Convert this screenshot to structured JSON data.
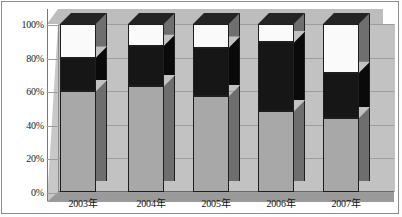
{
  "chart_data": {
    "type": "bar",
    "subtype": "stacked-100-percent-3d",
    "title": "",
    "xlabel": "",
    "ylabel": "",
    "ylim": [
      0,
      100
    ],
    "ytick_labels": [
      "0%",
      "20%",
      "40%",
      "60%",
      "80%",
      "100%"
    ],
    "ytick_values": [
      0,
      20,
      40,
      60,
      80,
      100
    ],
    "grid": true,
    "legend": "none",
    "categories": [
      "2003年",
      "2004年",
      "2005年",
      "2006年",
      "2007年"
    ],
    "series": [
      {
        "name": "bottom-gray",
        "color": "#a8a8a8",
        "values": [
          60,
          63,
          57,
          48,
          44
        ]
      },
      {
        "name": "middle-black",
        "color": "#161616",
        "values": [
          20,
          24,
          29,
          41,
          27
        ]
      },
      {
        "name": "top-white",
        "color": "#fafafa",
        "values": [
          20,
          13,
          14,
          11,
          29
        ]
      }
    ]
  },
  "axis": {
    "ticks": [
      {
        "label": "100%",
        "value": 100
      },
      {
        "label": "80%",
        "value": 80
      },
      {
        "label": "60%",
        "value": 60
      },
      {
        "label": "40%",
        "value": 40
      },
      {
        "label": "20%",
        "value": 20
      },
      {
        "label": "0%",
        "value": 0
      }
    ]
  },
  "categories": [
    {
      "label": "2003年"
    },
    {
      "label": "2004年"
    },
    {
      "label": "2005年"
    },
    {
      "label": "2006年"
    },
    {
      "label": "2007年"
    }
  ],
  "colors": {
    "gray": "#a8a8a8",
    "black": "#161616",
    "white": "#fafafa",
    "wall": "#c2c2c2",
    "floor": "#9a9a9a",
    "grid": "#9d9d9d"
  }
}
